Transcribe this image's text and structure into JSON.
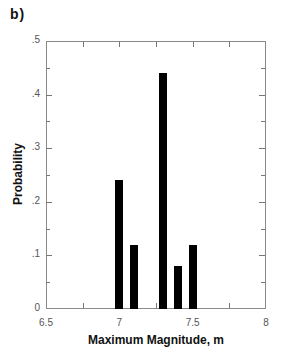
{
  "panel_label": "b)",
  "chart_data": {
    "type": "bar",
    "title": "",
    "xlabel": "Maximum Magnitude, m",
    "ylabel": "Probability",
    "x": [
      7.0,
      7.1,
      7.3,
      7.4,
      7.5
    ],
    "values": [
      0.24,
      0.12,
      0.44,
      0.08,
      0.12
    ],
    "xlim": [
      6.5,
      8.0
    ],
    "ylim": [
      0,
      0.5
    ],
    "xticks": [
      {
        "value": 6.5,
        "label": "6.5"
      },
      {
        "value": 7.0,
        "label": "7"
      },
      {
        "value": 7.5,
        "label": "7.5"
      },
      {
        "value": 8.0,
        "label": "8"
      }
    ],
    "yticks": [
      {
        "value": 0,
        "label": "0"
      },
      {
        "value": 0.1,
        "label": ".1"
      },
      {
        "value": 0.2,
        "label": ".2"
      },
      {
        "value": 0.3,
        "label": ".3"
      },
      {
        "value": 0.4,
        "label": ".4"
      },
      {
        "value": 0.5,
        "label": ".5"
      }
    ],
    "grid": false,
    "legend": null,
    "bar_color": "#000000"
  }
}
